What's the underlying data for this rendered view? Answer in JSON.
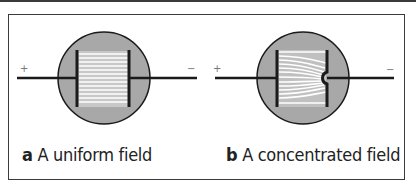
{
  "figure": {
    "panels": [
      {
        "letter": "a",
        "caption": "A uniform field",
        "positive_sign": "+",
        "negative_sign": "−",
        "field_type": "uniform"
      },
      {
        "letter": "b",
        "caption": "A concentrated field",
        "positive_sign": "+",
        "negative_sign": "−",
        "field_type": "concentrated"
      }
    ],
    "colors": {
      "circle_fill": "#a8a8a8",
      "gap_fill": "#c8c8c8",
      "field_line": "#ffffff",
      "stroke": "#1a1a1a"
    }
  }
}
